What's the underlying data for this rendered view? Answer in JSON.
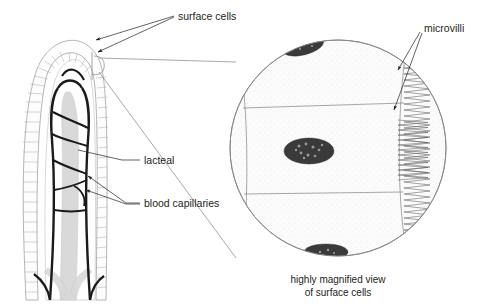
{
  "figure": {
    "background_color": "#ffffff",
    "width": 477,
    "height": 308
  },
  "labels": {
    "surface_cells": "surface cells",
    "lacteal": "lacteal",
    "blood_capillaries": "blood capillaries",
    "microvilli": "microvilli"
  },
  "caption": {
    "line1": "highly magnified view",
    "line2": "of surface cells"
  },
  "colors": {
    "text": "#231f20",
    "leader_line": "#231f20",
    "cell_outline": "#808285",
    "epithelium_outline": "#939598",
    "vessel": "#1a1a1a",
    "lacteal_fill": "#d9d9d9",
    "nucleus_fill": "#3b3b3b",
    "microvilli_stroke": "#58595b",
    "magnified_fill": "#fbfbfb"
  },
  "structures": {
    "villus": "finger-like intestinal villus shown in longitudinal section",
    "epithelium": "single layer of columnar surface cells drawn as a ladder pattern around the villus",
    "lacteal_vessel": "central grey lymphatic vessel running up the middle of the villus",
    "capillary_network": "dark looping blood capillaries inside the villus",
    "magnified_circle": "circular inset showing three surface cells with stippled nuclei and a microvilli brush border on the right",
    "nuclei_count": 3,
    "cells_count": 3
  }
}
